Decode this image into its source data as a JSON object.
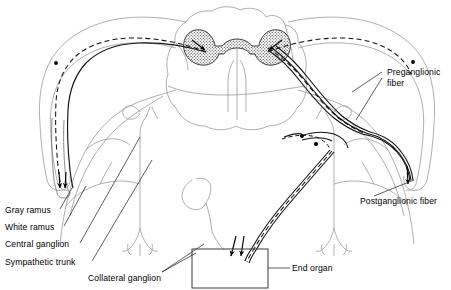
{
  "figure": {
    "kind": "anatomical-line-diagram",
    "background_color": "#ffffff",
    "ink_color": "#000000",
    "gray_matter_fill": "#b8b8b8",
    "faint_outline_color": "#9a9a9a"
  },
  "labels": {
    "gray_ramus": "Gray ramus",
    "white_ramus": "White ramus",
    "central_ganglion": "Central ganglion",
    "sympathetic_trunk": "Sympathetic trunk",
    "collateral_ganglion": "Collateral ganglion",
    "end_organ": "End organ",
    "preganglionic_fiber_line1": "Preganglionic",
    "preganglionic_fiber_line2": "fiber",
    "postganglionic_fiber": "Postganglionic fiber"
  },
  "structures": {
    "spinal_cord": "spinal-cord-cross-section",
    "gray_matter": "butterfly-gray-matter",
    "central_canal": "central-canal",
    "end_organ_box": "end-organ-rectangle",
    "preganglionic_path": "dashed-fiber",
    "postganglionic_path": "solid-fiber"
  }
}
